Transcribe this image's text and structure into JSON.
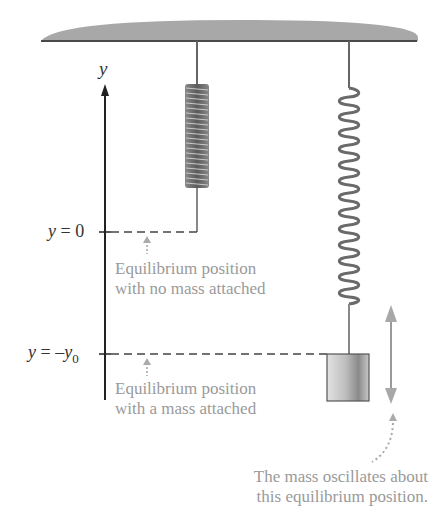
{
  "diagram": {
    "type": "spring-mass equilibrium",
    "axis": {
      "name": "y",
      "labels": {
        "y_zero": {
          "var": "y",
          "eq": " = 0"
        },
        "y_neg": {
          "var": "y",
          "eq": " = –",
          "var2": "y",
          "sub": "0"
        }
      }
    },
    "annotations": {
      "no_mass": {
        "line1": "Equilibrium position",
        "line2": "with no mass attached"
      },
      "with_mass": {
        "line1": "Equilibrium position",
        "line2": "with a mass attached"
      },
      "oscillation": {
        "line1": "The mass oscillates about",
        "line2": "this equilibrium position."
      }
    },
    "colors": {
      "ceiling": "#9e9e9e",
      "ceiling_line": "#555555",
      "spring": "#777777",
      "annotation_text": "#9a9a9a",
      "arrow_gray": "#a8a8a8",
      "axis": "#222222"
    }
  }
}
